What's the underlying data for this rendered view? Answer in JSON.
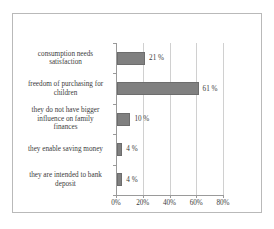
{
  "chart_data": {
    "type": "bar",
    "orientation": "horizontal",
    "title": "",
    "xlabel": "",
    "ylabel": "",
    "categories": [
      "consumption needs satisfaction",
      "freedom of purchasing for children",
      "they do not have bigger influence on family finances",
      "they enable saving money",
      "they are intended to bank deposit"
    ],
    "values": [
      21,
      61,
      10,
      4,
      4
    ],
    "value_labels": [
      "21 %",
      "61 %",
      "10 %",
      "4 %",
      "4 %"
    ],
    "xlim": [
      0,
      80
    ],
    "xticks": [
      0,
      20,
      40,
      60,
      80
    ],
    "xticklabels": [
      "0%",
      "20%",
      "40%",
      "60%",
      "80%"
    ],
    "grid": true,
    "grid_axis": "x",
    "legend": false,
    "bar_color": "#808080",
    "bar_border_color": "#6d6d6d",
    "axis_color": "#9a9a9a",
    "gridline_color": "#d0d0d0",
    "frame_color": "#b9b9b9",
    "background": "#ffffff"
  },
  "category_lines": [
    [
      "consumption needs",
      "satisfaction"
    ],
    [
      "freedom of purchasing for",
      "children"
    ],
    [
      "they do not have bigger",
      "influence on family",
      "finances"
    ],
    [
      "they enable saving money"
    ],
    [
      "they are intended to bank",
      "deposit"
    ]
  ]
}
